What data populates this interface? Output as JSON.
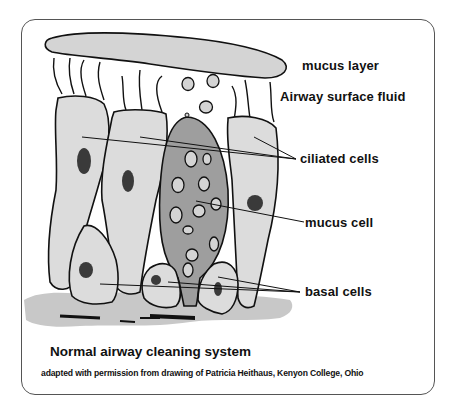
{
  "diagram": {
    "title": "Normal airway cleaning system",
    "credit": "adapted with permission from drawing of Patricia Heithaus, Kenyon College, Ohio",
    "labels": {
      "mucus_layer": "mucus layer",
      "airway_surface_fluid": "Airway surface fluid",
      "ciliated_cells": "ciliated cells",
      "mucus_cell": "mucus cell",
      "basal_cells": "basal cells"
    },
    "colors": {
      "cell_fill": "#dcdcdc",
      "mucus_cell_fill": "#9e9e9e",
      "nucleus": "#3a3a3a",
      "outline": "#111111",
      "basement": "#c8c8c8"
    }
  }
}
